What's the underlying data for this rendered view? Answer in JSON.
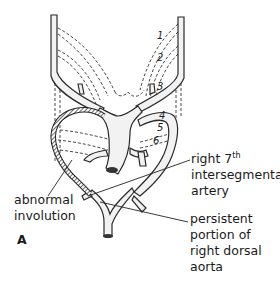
{
  "figure": {
    "panel_letter": "A",
    "arch_numbers": [
      "1",
      "2",
      "3",
      "4",
      "5",
      "6"
    ],
    "labels": {
      "right_7th_line1": "right 7",
      "right_7th_sup": "th",
      "right_7th_line2": "intersegmental",
      "right_7th_line3": "artery",
      "abnormal_line1": "abnormal",
      "abnormal_line2": "involution",
      "persistent_line1": "persistent",
      "persistent_line2": "portion  of",
      "persistent_line3": "right  dorsal",
      "persistent_line4": "aorta"
    },
    "colors": {
      "vessel_fill": "#f2f2f2",
      "vessel_outline": "#2a2a2a",
      "hatch": "#555555",
      "dashed": "#333333"
    }
  }
}
